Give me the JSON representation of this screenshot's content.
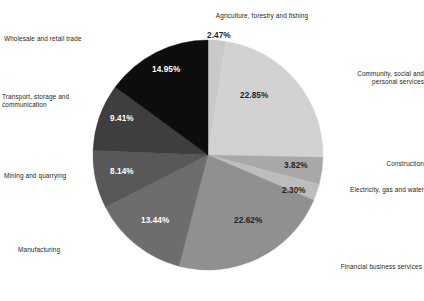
{
  "chart_data": {
    "type": "pie",
    "title": "",
    "subtitle": "",
    "xlabel": "",
    "ylabel": "",
    "legend_position": "callout-labels",
    "grid": false,
    "units": "percent",
    "start_angle_deg": 0,
    "direction": "clockwise",
    "categories": [
      "Agriculture, forestry and fishing",
      "Community, social and personal services",
      "Construction",
      "Electricity, gas and water",
      "Financial business services",
      "Manufacturing",
      "Mining and quarrying",
      "Transport, storage and communication",
      "Wholesale and retail trade"
    ],
    "values": [
      2.47,
      22.85,
      3.82,
      2.3,
      22.62,
      13.44,
      8.14,
      9.41,
      14.95
    ],
    "value_labels": [
      "2.47%",
      "22.85%",
      "3.82%",
      "2.30%",
      "22.62%",
      "13.44%",
      "8.14%",
      "9.41%",
      "14.95%"
    ],
    "colors": [
      "#c9c9c9",
      "#d2d2d2",
      "#a8a8a8",
      "#bdbdbd",
      "#909090",
      "#6d6d6d",
      "#585858",
      "#3e3e3e",
      "#0d0d0d"
    ],
    "slices": [
      {
        "label": "Agriculture, forestry and fishing",
        "value": 2.47,
        "value_label": "2.47%",
        "color": "#c9c9c9",
        "label_lines": "Agriculture, forestry and fishing",
        "value_text_color": "dark"
      },
      {
        "label": "Community, social and personal services",
        "value": 22.85,
        "value_label": "22.85%",
        "color": "#d2d2d2",
        "label_lines": "Community, social and\npersonal services",
        "value_text_color": "dark"
      },
      {
        "label": "Construction",
        "value": 3.82,
        "value_label": "3.82%",
        "color": "#a8a8a8",
        "label_lines": "Construction",
        "value_text_color": "dark"
      },
      {
        "label": "Electricity, gas and water",
        "value": 2.3,
        "value_label": "2.30%",
        "color": "#bdbdbd",
        "label_lines": "Electricity, gas and water",
        "value_text_color": "dark"
      },
      {
        "label": "Financial business services",
        "value": 22.62,
        "value_label": "22.62%",
        "color": "#909090",
        "label_lines": "Financial business services",
        "value_text_color": "dark"
      },
      {
        "label": "Manufacturing",
        "value": 13.44,
        "value_label": "13.44%",
        "color": "#6d6d6d",
        "label_lines": "Manufacturing",
        "value_text_color": "light"
      },
      {
        "label": "Mining and quarrying",
        "value": 8.14,
        "value_label": "8.14%",
        "color": "#585858",
        "label_lines": "Mining and quarrying",
        "value_text_color": "light"
      },
      {
        "label": "Transport, storage and communication",
        "value": 9.41,
        "value_label": "9.41%",
        "color": "#3e3e3e",
        "label_lines": "Transport, storage and\ncommunication",
        "value_text_color": "light"
      },
      {
        "label": "Wholesale and retail trade",
        "value": 14.95,
        "value_label": "14.95%",
        "color": "#0d0d0d",
        "label_lines": "Wholesale and retail trade",
        "value_text_color": "light"
      }
    ]
  }
}
